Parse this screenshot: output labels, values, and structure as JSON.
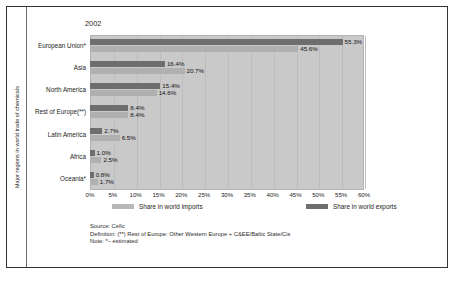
{
  "figure": {
    "title": "2002",
    "y_axis_title": "Major regions in world trade of chemicals"
  },
  "legend": {
    "imports_label": "Share in world imports",
    "exports_label": "Share in world exports",
    "imports_color": "#b8b8b8",
    "exports_color": "#6e6e6e"
  },
  "notes": {
    "source": "Source: Cefic",
    "definition": "Definition: (**) Rest of Europe: Other Western Europe + C&EE/Baltic State/Cis",
    "note": "Note: *– estimated"
  },
  "chart_data": {
    "type": "bar",
    "orientation": "horizontal",
    "title": "2002",
    "xlabel": "",
    "ylabel": "Major regions in world trade of chemicals",
    "xlim": [
      0,
      60
    ],
    "xticks": [
      "0%",
      "5%",
      "10%",
      "15%",
      "20%",
      "25%",
      "30%",
      "35%",
      "40%",
      "45%",
      "50%",
      "55%",
      "60%"
    ],
    "grid": true,
    "legend_position": "bottom",
    "categories": [
      "European Union*",
      "Asia",
      "North America",
      "Rest of Europe(**)",
      "Latin America",
      "Africa",
      "Oceania*"
    ],
    "series": [
      {
        "name": "Share in world exports",
        "color": "#6e6e6e",
        "values": [
          55.3,
          16.4,
          15.4,
          8.4,
          2.7,
          1.0,
          0.8
        ],
        "labels": [
          "55.3%",
          "16.4%",
          "15.4%",
          "8.4%",
          "2.7%",
          "1.0%",
          "0.8%"
        ]
      },
      {
        "name": "Share in world imports",
        "color": "#b0b0b0",
        "values": [
          45.6,
          20.7,
          14.6,
          8.4,
          6.5,
          2.5,
          1.7
        ],
        "labels": [
          "45.6%",
          "20.7%",
          "14.6%",
          "8.4%",
          "6.5%",
          "2.5%",
          "1.7%"
        ]
      }
    ]
  }
}
